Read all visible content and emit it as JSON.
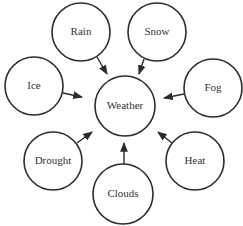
{
  "diagram": {
    "type": "concept-map",
    "center": {
      "id": "weather",
      "label": "Weather",
      "cx": 125,
      "cy": 106,
      "r": 30
    },
    "nodes": [
      {
        "id": "rain",
        "label": "Rain",
        "cx": 81,
        "cy": 32,
        "r": 29
      },
      {
        "id": "snow",
        "label": "Snow",
        "cx": 157,
        "cy": 32,
        "r": 29
      },
      {
        "id": "ice",
        "label": "Ice",
        "cx": 34,
        "cy": 86,
        "r": 29
      },
      {
        "id": "fog",
        "label": "Fog",
        "cx": 213,
        "cy": 88,
        "r": 29
      },
      {
        "id": "drought",
        "label": "Drought",
        "cx": 53,
        "cy": 161,
        "r": 29
      },
      {
        "id": "heat",
        "label": "Heat",
        "cx": 195,
        "cy": 161,
        "r": 29
      },
      {
        "id": "clouds",
        "label": "Clouds",
        "cx": 123,
        "cy": 194,
        "r": 30
      }
    ],
    "edges": [
      {
        "from": "rain",
        "to": "weather",
        "x1": 97,
        "y1": 57,
        "x2": 107,
        "y2": 74
      },
      {
        "from": "snow",
        "to": "weather",
        "x1": 144,
        "y1": 59,
        "x2": 139,
        "y2": 74
      },
      {
        "from": "ice",
        "to": "weather",
        "x1": 63,
        "y1": 93,
        "x2": 82,
        "y2": 97
      },
      {
        "from": "fog",
        "to": "weather",
        "x1": 184,
        "y1": 94,
        "x2": 164,
        "y2": 98
      },
      {
        "from": "drought",
        "to": "weather",
        "x1": 77,
        "y1": 143,
        "x2": 92,
        "y2": 132
      },
      {
        "from": "heat",
        "to": "weather",
        "x1": 172,
        "y1": 143,
        "x2": 158,
        "y2": 132
      },
      {
        "from": "clouds",
        "to": "weather",
        "x1": 124,
        "y1": 164,
        "x2": 124,
        "y2": 143
      }
    ],
    "colors": {
      "stroke": "#2b2b2b",
      "text": "#333333",
      "background": "#ffffff"
    }
  }
}
